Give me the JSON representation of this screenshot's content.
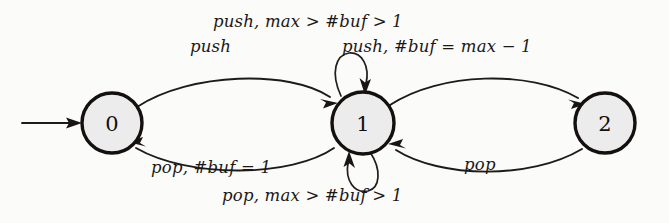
{
  "figure": {
    "type": "state-transition-diagram",
    "background_color": "#fbfbf9",
    "node_fill_color": "#ececec",
    "stroke_color": "#181514"
  },
  "states": [
    {
      "id": "s0",
      "label": "0",
      "cx": 112,
      "cy": 123,
      "r": 30,
      "initial": true
    },
    {
      "id": "s1",
      "label": "1",
      "cx": 363,
      "cy": 123,
      "r": 31,
      "initial": false
    },
    {
      "id": "s2",
      "label": "2",
      "cx": 605,
      "cy": 123,
      "r": 30,
      "initial": false
    }
  ],
  "transitions": [
    {
      "id": "t_init",
      "from": "",
      "to": "0",
      "label": ""
    },
    {
      "id": "t01",
      "from": "0",
      "to": "1",
      "label": "push"
    },
    {
      "id": "t10",
      "from": "1",
      "to": "0",
      "label": "pop, #buf = 1"
    },
    {
      "id": "t11a",
      "from": "1",
      "to": "1",
      "label": "push, max > #buf > 1"
    },
    {
      "id": "t11b",
      "from": "1",
      "to": "1",
      "label": "pop, max > #buf > 1"
    },
    {
      "id": "t12",
      "from": "1",
      "to": "2",
      "label": "push, #buf = max − 1"
    },
    {
      "id": "t21",
      "from": "2",
      "to": "1",
      "label": "pop"
    }
  ],
  "labels": {
    "push_top": "push, max > #buf > 1",
    "push": "push",
    "push_max": "push, #buf = max − 1",
    "pop_buf1": "pop, #buf = 1",
    "pop_right": "pop",
    "pop_max": "pop, max > #buf > 1"
  },
  "state_labels": {
    "zero": "0",
    "one": "1",
    "two": "2"
  }
}
